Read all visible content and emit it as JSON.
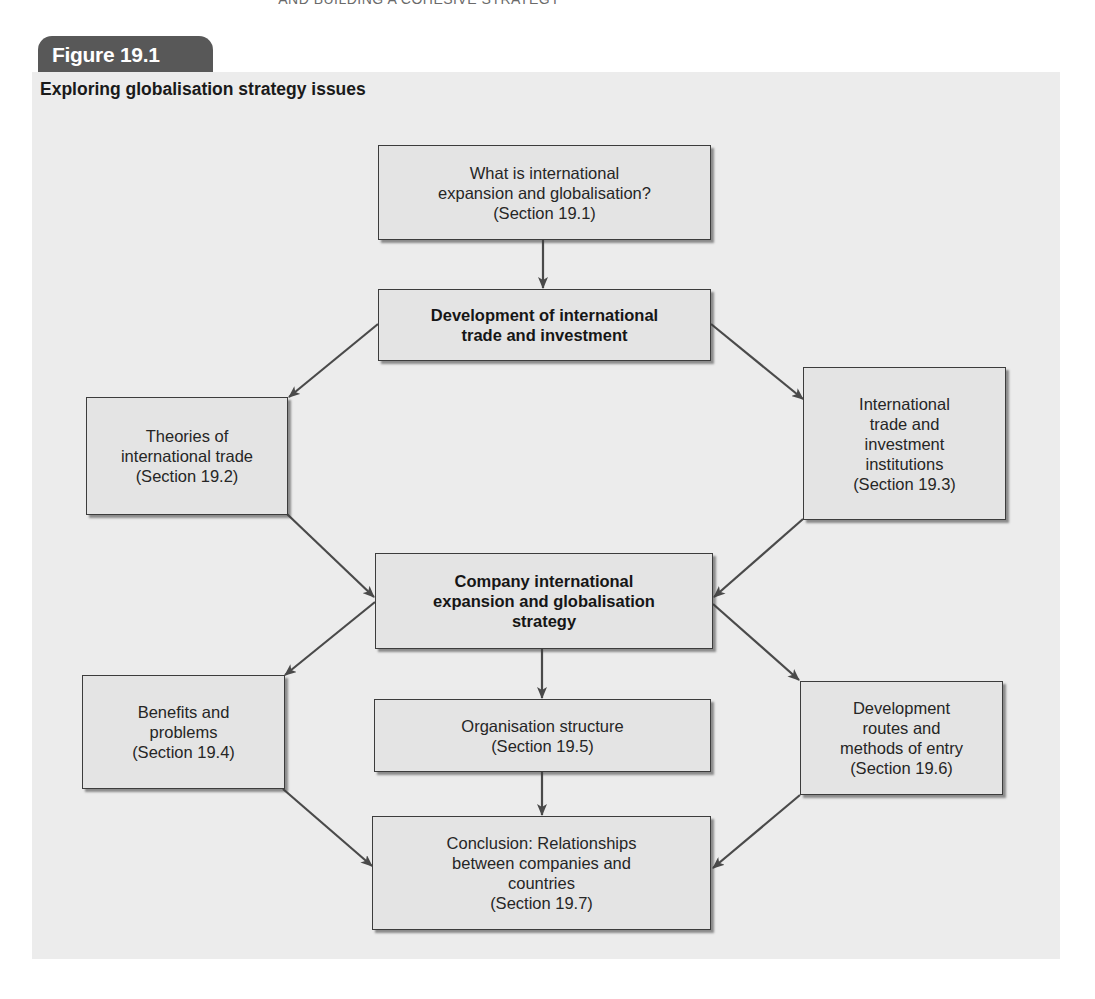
{
  "page": {
    "running_head": "AND BUILDING A COHESIVE STRATEGY"
  },
  "figure": {
    "label": "Figure 19.1",
    "title": "Exploring globalisation strategy issues",
    "colors": {
      "tab": "#585858",
      "panel": "#ececec",
      "box_fill": "#e4e4e4",
      "box_border": "#3c3c3c",
      "arrow": "#4a4a4a"
    }
  },
  "nodes": {
    "n1": {
      "lines": [
        "What is international",
        "expansion and globalisation?",
        "(Section 19.1)"
      ]
    },
    "n2": {
      "lines": [
        "Development of international",
        "trade and investment"
      ]
    },
    "n3": {
      "lines": [
        "Theories of",
        "international trade",
        "(Section 19.2)"
      ]
    },
    "n4": {
      "lines": [
        "International",
        "trade and",
        "investment",
        "institutions",
        "(Section 19.3)"
      ]
    },
    "n5": {
      "lines": [
        "Company international",
        "expansion and globalisation",
        "strategy"
      ]
    },
    "n6": {
      "lines": [
        "Benefits and",
        "problems",
        "(Section 19.4)"
      ]
    },
    "n7": {
      "lines": [
        "Organisation structure",
        "(Section 19.5)"
      ]
    },
    "n8": {
      "lines": [
        "Development",
        "routes and",
        "methods of entry",
        "(Section 19.6)"
      ]
    },
    "n9": {
      "lines": [
        "Conclusion: Relationships",
        "between companies and",
        "countries",
        "(Section 19.7)"
      ]
    }
  },
  "edges": [
    {
      "from": "n1",
      "to": "n2"
    },
    {
      "from": "n2",
      "to": "n3"
    },
    {
      "from": "n2",
      "to": "n4"
    },
    {
      "from": "n3",
      "to": "n5"
    },
    {
      "from": "n4",
      "to": "n5"
    },
    {
      "from": "n5",
      "to": "n6"
    },
    {
      "from": "n5",
      "to": "n7"
    },
    {
      "from": "n5",
      "to": "n8"
    },
    {
      "from": "n6",
      "to": "n9"
    },
    {
      "from": "n7",
      "to": "n9"
    },
    {
      "from": "n8",
      "to": "n9"
    }
  ]
}
